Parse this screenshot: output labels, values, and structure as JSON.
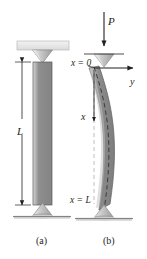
{
  "figure": {
    "background_color": "#ffffff",
    "width": 147,
    "height": 259
  },
  "panels": [
    {
      "id": "a",
      "caption": "(a)",
      "description": "Straight pin-ended column of length L",
      "elements": {
        "dimension_label": "L",
        "top_support": "knife-edge-pin-support",
        "bottom_support": "cone-pin-support"
      }
    },
    {
      "id": "b",
      "caption": "(b)",
      "description": "Buckled column under axial compressive load P",
      "elements": {
        "load_label": "P",
        "origin_label": "x = 0",
        "end_label": "x = L",
        "axis_y_label": "y",
        "axis_x_label": "x",
        "top_support": "knife-edge-pin-support",
        "bottom_support": "cone-pin-support"
      }
    }
  ],
  "colors": {
    "column_fill": "#8c8c8c",
    "column_fill_light": "#b8b8b8",
    "column_edge": "#4d4d4d",
    "support_fill": "#c9c9c9",
    "plate_fill": "#e8e8e8",
    "line": "#231f20",
    "text": "#231f20",
    "centerline": "#3a3a3a"
  }
}
